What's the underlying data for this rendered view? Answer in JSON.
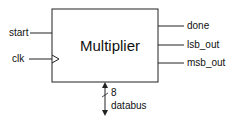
{
  "diagram": {
    "block": {
      "title": "Multiplier"
    },
    "inputs": [
      {
        "label": "start"
      },
      {
        "label": "clk"
      }
    ],
    "outputs": [
      {
        "label": "done"
      },
      {
        "label": "lsb_out"
      },
      {
        "label": "msb_out"
      }
    ],
    "bus": {
      "width": "8",
      "label": "databus"
    }
  }
}
